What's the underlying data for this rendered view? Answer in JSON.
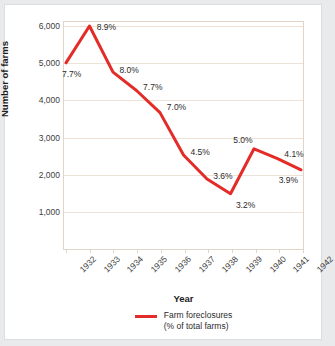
{
  "chart_data": {
    "type": "line",
    "title": "",
    "subtitle": "",
    "xlabel": "Year",
    "ylabel": "Number of farms",
    "categories": [
      "1932",
      "1933",
      "1934",
      "1935",
      "1936",
      "1937",
      "1938",
      "1939",
      "1940",
      "1941",
      "1942"
    ],
    "values": [
      5000,
      6000,
      4750,
      4250,
      3650,
      2500,
      1850,
      1450,
      2670,
      2400,
      2100
    ],
    "point_labels": [
      "7.7%",
      "8.9%",
      "8.0%",
      "7.7%",
      "7.0%",
      "4.5%",
      "3.6%",
      "3.2%",
      "5.0%",
      "4.1%",
      "3.9%"
    ],
    "series": [
      {
        "name": "Farm foreclosures (% of total farms)",
        "color": "#e32b28",
        "values": [
          5000,
          6000,
          4750,
          4250,
          3650,
          2500,
          1850,
          1450,
          2670,
          2400,
          2100
        ],
        "data_labels": [
          "7.7%",
          "8.9%",
          "8.0%",
          "7.7%",
          "7.0%",
          "4.5%",
          "3.6%",
          "3.2%",
          "5.0%",
          "4.1%",
          "3.9%"
        ]
      }
    ],
    "ylim": [
      0,
      6000
    ],
    "yticks": [
      6000,
      5000,
      4000,
      3000,
      2000,
      1000
    ],
    "ytick_labels": [
      "6,000",
      "5,000",
      "4,000",
      "3,000",
      "2,000",
      "1,000"
    ],
    "grid": true,
    "grid_axis": "y",
    "legend_position": "bottom"
  },
  "axes": {
    "y_title": "Number of farms",
    "x_title": "Year"
  },
  "legend": {
    "line_1": "Farm foreclosures",
    "line_2": "(% of total farms)",
    "swatch_color": "#e32b28"
  },
  "colors": {
    "line": "#e32b28",
    "gridline": "#ede2d5",
    "frame": "#e0d5c8",
    "card_background": "#ffffff",
    "page_background": "#e9eaec",
    "text": "#2b2b2b"
  }
}
